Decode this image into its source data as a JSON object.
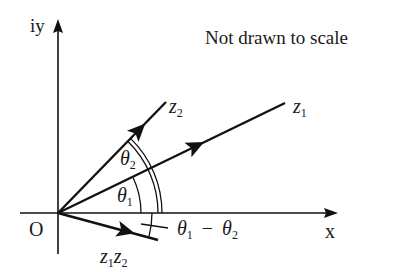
{
  "diagram": {
    "note": "Not drawn to scale",
    "colors": {
      "ink": "#111111",
      "background": "#ffffff"
    },
    "axes": {
      "x_label": "x",
      "y_label": "iy",
      "origin_label": "O"
    },
    "vectors": [
      {
        "id": "z1",
        "base": "z",
        "sub": "1",
        "angle_label": "θ",
        "angle_sub": "1"
      },
      {
        "id": "z2",
        "base": "z",
        "sub": "2",
        "angle_label": "θ",
        "angle_sub": "2"
      },
      {
        "id": "z1z2",
        "base1": "z",
        "sub1": "1",
        "base2": "z",
        "sub2": "2"
      }
    ],
    "angles": {
      "theta1": {
        "symbol": "θ",
        "sub": "1",
        "arc": "single"
      },
      "theta2": {
        "symbol": "θ",
        "sub": "2",
        "arc": "double"
      },
      "difference": {
        "symbol1": "θ",
        "sub1": "1",
        "op": "−",
        "symbol2": "θ",
        "sub2": "2",
        "arc": "single with tick"
      }
    }
  }
}
